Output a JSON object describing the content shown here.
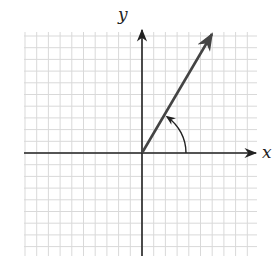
{
  "diagram": {
    "type": "coordinate-plane-angle",
    "x_axis_label": "x",
    "y_axis_label": "y",
    "grid": {
      "left": 24,
      "right": 257,
      "top": 32,
      "bottom": 256,
      "cell_size": 11.7,
      "color": "#d9d9d9"
    },
    "origin": {
      "x": 142,
      "y": 153
    },
    "ray": {
      "description": "terminal side of angle in quadrant I",
      "end": {
        "x": 212,
        "y": 34
      },
      "color": "#444444"
    },
    "angle_arc": {
      "radius": 44,
      "from_deg": 0,
      "to_deg": 59,
      "direction": "counterclockwise",
      "has_arrowhead": true
    },
    "colors": {
      "axis": "#222222",
      "ray": "#444444",
      "grid": "#d9d9d9"
    }
  }
}
